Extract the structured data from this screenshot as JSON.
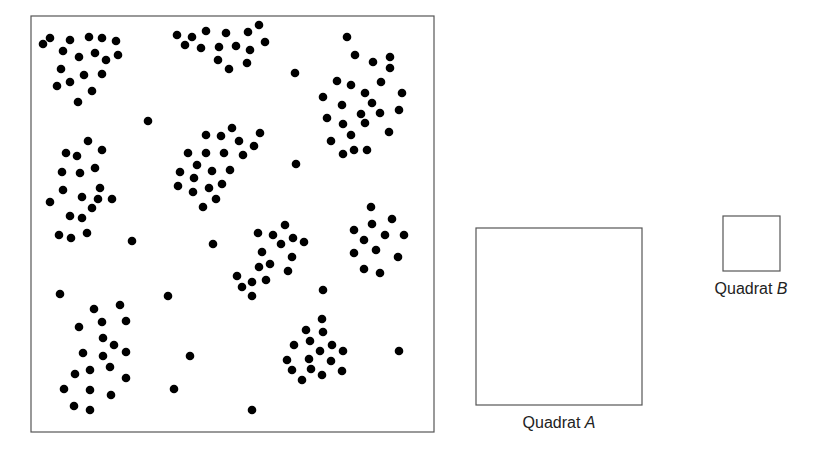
{
  "figure": {
    "colors": {
      "dot": "#000000",
      "frame": "#555555",
      "text": "#222222",
      "background": "#ffffff"
    },
    "study_area": {
      "frame": {
        "x": 31,
        "y": 16,
        "w": 403,
        "h": 416
      },
      "dot_radius": 4.3,
      "clusters": [
        [
          [
            43,
            44
          ],
          [
            50,
            38
          ],
          [
            70,
            40
          ],
          [
            89,
            37
          ],
          [
            102,
            38
          ],
          [
            116,
            41
          ],
          [
            63,
            51
          ],
          [
            79,
            57
          ],
          [
            95,
            53
          ],
          [
            106,
            60
          ],
          [
            118,
            55
          ],
          [
            61,
            69
          ],
          [
            84,
            75
          ],
          [
            102,
            74
          ],
          [
            57,
            86
          ],
          [
            70,
            82
          ],
          [
            92,
            91
          ],
          [
            78,
            102
          ]
        ],
        [
          [
            177,
            35
          ],
          [
            192,
            37
          ],
          [
            206,
            31
          ],
          [
            226,
            33
          ],
          [
            248,
            32
          ],
          [
            259,
            25
          ],
          [
            185,
            45
          ],
          [
            201,
            48
          ],
          [
            219,
            47
          ],
          [
            236,
            46
          ],
          [
            250,
            50
          ],
          [
            265,
            42
          ],
          [
            218,
            60
          ],
          [
            229,
            69
          ],
          [
            247,
            63
          ]
        ],
        [
          [
            355,
            55
          ],
          [
            373,
            62
          ],
          [
            390,
            57
          ],
          [
            390,
            68
          ],
          [
            337,
            81
          ],
          [
            351,
            85
          ],
          [
            381,
            82
          ],
          [
            365,
            93
          ],
          [
            402,
            93
          ],
          [
            323,
            97
          ],
          [
            342,
            105
          ],
          [
            372,
            103
          ],
          [
            399,
            110
          ],
          [
            327,
            118
          ],
          [
            361,
            114
          ],
          [
            380,
            113
          ],
          [
            343,
            124
          ],
          [
            365,
            123
          ],
          [
            389,
            132
          ],
          [
            331,
            141
          ],
          [
            351,
            135
          ],
          [
            367,
            150
          ],
          [
            354,
            150
          ],
          [
            343,
            154
          ]
        ],
        [
          [
            88,
            141
          ],
          [
            66,
            153
          ],
          [
            77,
            156
          ],
          [
            102,
            150
          ],
          [
            62,
            172
          ],
          [
            80,
            173
          ],
          [
            95,
            168
          ],
          [
            63,
            190
          ],
          [
            100,
            188
          ],
          [
            82,
            197
          ],
          [
            98,
            199
          ],
          [
            112,
            199
          ],
          [
            50,
            202
          ],
          [
            92,
            208
          ],
          [
            70,
            216
          ],
          [
            82,
            218
          ],
          [
            59,
            235
          ],
          [
            71,
            238
          ],
          [
            87,
            233
          ]
        ],
        [
          [
            232,
            128
          ],
          [
            206,
            135
          ],
          [
            221,
            136
          ],
          [
            260,
            133
          ],
          [
            239,
            141
          ],
          [
            254,
            146
          ],
          [
            188,
            153
          ],
          [
            206,
            153
          ],
          [
            224,
            153
          ],
          [
            243,
            155
          ],
          [
            197,
            165
          ],
          [
            180,
            172
          ],
          [
            212,
            171
          ],
          [
            230,
            170
          ],
          [
            194,
            178
          ],
          [
            178,
            186
          ],
          [
            193,
            192
          ],
          [
            209,
            188
          ],
          [
            222,
            184
          ],
          [
            216,
            199
          ],
          [
            203,
            207
          ]
        ],
        [
          [
            285,
            225
          ],
          [
            258,
            233
          ],
          [
            273,
            235
          ],
          [
            293,
            238
          ],
          [
            304,
            242
          ],
          [
            281,
            244
          ],
          [
            262,
            252
          ],
          [
            292,
            257
          ],
          [
            259,
            267
          ],
          [
            270,
            264
          ],
          [
            288,
            271
          ],
          [
            237,
            276
          ],
          [
            266,
            280
          ],
          [
            252,
            282
          ],
          [
            242,
            287
          ],
          [
            252,
            296
          ]
        ],
        [
          [
            371,
            207
          ],
          [
            392,
            219
          ],
          [
            372,
            224
          ],
          [
            354,
            230
          ],
          [
            385,
            235
          ],
          [
            404,
            235
          ],
          [
            364,
            240
          ],
          [
            376,
            250
          ],
          [
            354,
            253
          ],
          [
            398,
            257
          ],
          [
            364,
            269
          ],
          [
            380,
            273
          ]
        ],
        [
          [
            120,
            305
          ],
          [
            94,
            309
          ],
          [
            102,
            322
          ],
          [
            126,
            321
          ],
          [
            79,
            327
          ],
          [
            103,
            338
          ],
          [
            114,
            345
          ],
          [
            83,
            353
          ],
          [
            103,
            356
          ],
          [
            126,
            352
          ],
          [
            110,
            367
          ],
          [
            75,
            374
          ],
          [
            90,
            370
          ],
          [
            126,
            378
          ],
          [
            64,
            389
          ],
          [
            90,
            390
          ],
          [
            111,
            395
          ],
          [
            74,
            406
          ],
          [
            90,
            410
          ]
        ],
        [
          [
            322,
            319
          ],
          [
            306,
            330
          ],
          [
            323,
            332
          ],
          [
            294,
            345
          ],
          [
            310,
            341
          ],
          [
            332,
            345
          ],
          [
            343,
            351
          ],
          [
            320,
            351
          ],
          [
            287,
            360
          ],
          [
            309,
            359
          ],
          [
            331,
            361
          ],
          [
            292,
            370
          ],
          [
            311,
            369
          ],
          [
            342,
            371
          ],
          [
            322,
            375
          ],
          [
            302,
            380
          ]
        ]
      ],
      "isolated": [
        [
          347,
          37
        ],
        [
          295,
          73
        ],
        [
          148,
          121
        ],
        [
          296,
          164
        ],
        [
          132,
          241
        ],
        [
          213,
          244
        ],
        [
          60,
          294
        ],
        [
          168,
          296
        ],
        [
          323,
          290
        ],
        [
          190,
          356
        ],
        [
          399,
          351
        ],
        [
          174,
          389
        ],
        [
          252,
          410
        ]
      ]
    },
    "quadrats": [
      {
        "id": "A",
        "label_prefix": "Quadrat ",
        "label_letter": "A",
        "box": {
          "x": 476,
          "y": 228,
          "w": 166,
          "h": 177
        },
        "label_x": 559,
        "label_y": 414
      },
      {
        "id": "B",
        "label_prefix": "Quadrat ",
        "label_letter": "B",
        "box": {
          "x": 723,
          "y": 216,
          "w": 57,
          "h": 55
        },
        "label_x": 751,
        "label_y": 280
      }
    ]
  }
}
